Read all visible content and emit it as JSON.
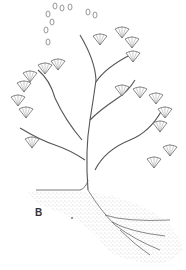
{
  "figure": {
    "panel_label": "B",
    "colors": {
      "ink": "#555555",
      "stipple": "#9a9a9a",
      "background": "#ffffff"
    }
  }
}
